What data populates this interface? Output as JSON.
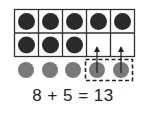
{
  "diagram": {
    "ten_frame": {
      "rows": 2,
      "cols": 5,
      "filled_cells": [
        [
          1,
          1,
          1,
          1,
          1
        ],
        [
          1,
          1,
          1,
          0,
          0
        ]
      ],
      "dot_color": "#2a2a2a",
      "grid_color": "#333333"
    },
    "counters": {
      "count": 5,
      "color": "#7a7a7a",
      "moved_count": 2,
      "moved_box_style": "dashed"
    },
    "arrows": [
      {
        "from": "counter-4",
        "to": "row2-col4"
      },
      {
        "from": "counter-5",
        "to": "row2-col5"
      }
    ],
    "equation": "8 + 5 = 13"
  }
}
